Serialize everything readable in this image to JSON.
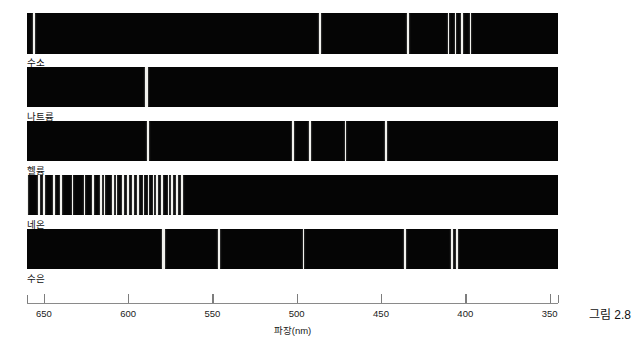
{
  "figure": {
    "caption": "그림 2.8",
    "axis_title": "파장(nm)"
  },
  "chart_data": {
    "type": "line",
    "title": "",
    "subtitle": "",
    "xlabel": "파장(nm)",
    "ylabel": "",
    "xlim": [
      660,
      345
    ],
    "x_axis_reversed": true,
    "grid": false,
    "legend": "none",
    "tick_labels": [
      "650",
      "600",
      "550",
      "500",
      "450",
      "400",
      "350"
    ],
    "tick_values": [
      650,
      600,
      550,
      500,
      450,
      400,
      350
    ],
    "units": "nm",
    "series": [
      {
        "name": "수소",
        "element_en": "hydrogen",
        "band_color": "#050505",
        "line_color": "#f2f2ee",
        "values": [
          656,
          486,
          434,
          410,
          406,
          402,
          397
        ],
        "line_widths_px": [
          2.0,
          2.0,
          1.8,
          1.5,
          1.3,
          1.3,
          1.6
        ]
      },
      {
        "name": "나트륨",
        "element_en": "sodium",
        "band_color": "#050505",
        "line_color": "#f2f2ee",
        "values": [
          589
        ],
        "line_widths_px": [
          2.4
        ]
      },
      {
        "name": "헬륨",
        "element_en": "helium",
        "band_color": "#050505",
        "line_color": "#f2f2ee",
        "values": [
          706,
          588,
          502,
          492,
          471,
          447
        ],
        "line_widths_px": [
          1.6,
          2.0,
          1.8,
          1.6,
          1.8,
          1.8
        ]
      },
      {
        "name": "네온",
        "element_en": "neon",
        "band_color": "#050505",
        "line_color": "#f2f2ee",
        "values": [
          671,
          667,
          660,
          653,
          650,
          644,
          640,
          633,
          626,
          621,
          616,
          614,
          609,
          607,
          603,
          600,
          597,
          594,
          591,
          588,
          585,
          583,
          580,
          576,
          574,
          571,
          568
        ],
        "line_widths_px": [
          1.6,
          1.6,
          1.6,
          1.6,
          1.6,
          1.6,
          1.6,
          1.6,
          1.6,
          1.6,
          1.6,
          1.6,
          1.6,
          1.6,
          1.6,
          1.6,
          1.6,
          1.6,
          1.6,
          1.6,
          1.6,
          1.6,
          1.6,
          1.6,
          1.6,
          1.6,
          1.6
        ]
      },
      {
        "name": "수은",
        "element_en": "mercury",
        "band_color": "#050505",
        "line_color": "#f2f2ee",
        "values": [
          579,
          546,
          496,
          436,
          408,
          405
        ],
        "line_widths_px": [
          2.2,
          2.0,
          1.8,
          2.0,
          1.6,
          1.6
        ]
      }
    ]
  }
}
